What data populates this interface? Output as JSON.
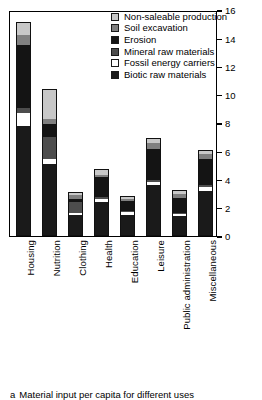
{
  "chart_data": {
    "type": "bar",
    "subtype": "stacked-vertical",
    "title": "",
    "xlabel": "",
    "ylabel": "",
    "ylim": [
      0,
      16
    ],
    "yticks": [
      0,
      2,
      4,
      6,
      8,
      10,
      12,
      14,
      16
    ],
    "ytick_labels": [
      "0",
      "2",
      "4",
      "6",
      "8",
      "10",
      "12",
      "14",
      "16"
    ],
    "grid": false,
    "legend_position": "top-right-inside",
    "categories": [
      "Housing",
      "Nutrition",
      "Clothing",
      "Health",
      "Education",
      "Leisure",
      "Public administration",
      "Miscellaneous"
    ],
    "series": [
      {
        "name": "Biotic raw materials",
        "color": "#1a1a1a",
        "values": [
          7.8,
          5.1,
          1.5,
          2.4,
          1.5,
          3.6,
          1.4,
          3.2
        ]
      },
      {
        "name": "Fossil energy carriers",
        "color": "#ffffff",
        "values": [
          0.9,
          0.35,
          0.1,
          0.25,
          0.2,
          0.25,
          0.15,
          0.3
        ]
      },
      {
        "name": "Mineral raw materials",
        "color": "#4d4d4d",
        "values": [
          0.35,
          1.55,
          0.85,
          0.1,
          0.1,
          0.1,
          0.1,
          0.1
        ]
      },
      {
        "name": "Erosion",
        "color": "#141414",
        "values": [
          4.5,
          1.0,
          0.25,
          1.5,
          0.7,
          2.3,
          1.1,
          1.9
        ]
      },
      {
        "name": "Soil excavation",
        "color": "#808080",
        "values": [
          0.75,
          0.3,
          0.25,
          0.15,
          0.15,
          0.4,
          0.3,
          0.35
        ]
      },
      {
        "name": "Non-saleable production",
        "color": "#c8c8c8",
        "values": [
          0.85,
          2.1,
          0.2,
          0.35,
          0.15,
          0.3,
          0.2,
          0.25
        ]
      }
    ],
    "totals": [
      15.15,
      10.4,
      3.15,
      4.75,
      2.8,
      6.95,
      3.25,
      6.1
    ],
    "legend_entries": [
      "Non-saleable production",
      "Soil excavation",
      "Erosion",
      "Mineral raw materials",
      "Fossil energy carriers",
      "Biotic raw materials"
    ]
  },
  "caption": {
    "marker": "a",
    "text": "Material input per capita for different uses"
  }
}
